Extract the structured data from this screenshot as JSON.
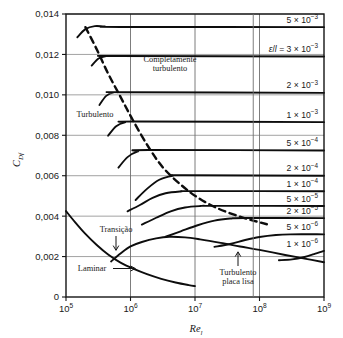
{
  "chart_data": {
    "type": "line",
    "title": "",
    "xlabel": "Re",
    "xlabel_sub": "l",
    "ylabel": "C",
    "ylabel_sub": "Df",
    "xscale": "log",
    "yscale": "linear",
    "xlim": [
      100000,
      1000000000
    ],
    "ylim": [
      0,
      0.014
    ],
    "grid": true,
    "xticks": [
      {
        "value": 100000,
        "mantissa": "10",
        "exponent": "5"
      },
      {
        "value": 1000000,
        "mantissa": "10",
        "exponent": "6"
      },
      {
        "value": 10000000,
        "mantissa": "10",
        "exponent": "7"
      },
      {
        "value": 100000000,
        "mantissa": "10",
        "exponent": "8"
      },
      {
        "value": 1000000000,
        "mantissa": "10",
        "exponent": "9"
      }
    ],
    "yticks": [
      {
        "value": 0,
        "label": "0"
      },
      {
        "value": 0.002,
        "label": "0,002"
      },
      {
        "value": 0.004,
        "label": "0,004"
      },
      {
        "value": 0.006,
        "label": "0,006"
      },
      {
        "value": 0.008,
        "label": "0,008"
      },
      {
        "value": 0.01,
        "label": "0,010"
      },
      {
        "value": 0.012,
        "label": "0,012"
      },
      {
        "value": 0.014,
        "label": "0,014"
      }
    ],
    "right_labels": [
      {
        "id": "r5e3",
        "text": "5 × 10",
        "exp": "-3",
        "plateau": 0.01335,
        "prefix": ""
      },
      {
        "id": "r3e3",
        "text": " = 3 × 10",
        "exp": "-3",
        "plateau": 0.0119,
        "prefix": "eps_over_l"
      },
      {
        "id": "r2e3",
        "text": "2 × 10",
        "exp": "-3",
        "plateau": 0.0101,
        "prefix": ""
      },
      {
        "id": "r1e3",
        "text": "1 × 10",
        "exp": "-3",
        "plateau": 0.00865,
        "prefix": ""
      },
      {
        "id": "r5e4",
        "text": "5 × 10",
        "exp": "-4",
        "plateau": 0.00725,
        "prefix": ""
      },
      {
        "id": "r2e4",
        "text": "2 × 10",
        "exp": "-4",
        "plateau": 0.006,
        "prefix": ""
      },
      {
        "id": "r1e4",
        "text": "1 × 10",
        "exp": "-4",
        "plateau": 0.00523,
        "prefix": ""
      },
      {
        "id": "r5e5",
        "text": "5 × 10",
        "exp": "-5",
        "plateau": 0.0045,
        "prefix": ""
      },
      {
        "id": "r2e5",
        "text": "2 × 10",
        "exp": "-5",
        "plateau": 0.0039,
        "prefix": ""
      },
      {
        "id": "r5e6",
        "text": "5 × 10",
        "exp": "-6",
        "plateau": 0.0031,
        "prefix": ""
      },
      {
        "id": "r1e6",
        "text": "1 × 10",
        "exp": "-6",
        "plateau": 0.00225,
        "prefix": ""
      }
    ],
    "eps_symbol": "ε",
    "eps_denominator": "l",
    "annotations": [
      {
        "id": "completamente-turbulento",
        "line1": "Completamente",
        "line2": "turbulento",
        "x": 170,
        "y": 62
      },
      {
        "id": "turbulento",
        "line1": "Turbulento",
        "line2": "",
        "x": 95,
        "y": 117
      },
      {
        "id": "transicao",
        "line1": "Transição",
        "line2": "",
        "x": 116,
        "y": 232
      },
      {
        "id": "laminar",
        "line1": "Laminar",
        "line2": "",
        "x": 92,
        "y": 271
      },
      {
        "id": "turbulento-placa-lisa",
        "line1": "Turbulento",
        "line2": "placa lisa",
        "x": 238,
        "y": 275
      }
    ],
    "series": [
      {
        "name": "laminar",
        "style": "solid",
        "points": [
          [
            100000,
            0.00425
          ],
          [
            140000,
            0.00368
          ],
          [
            200000,
            0.00312
          ],
          [
            300000,
            0.00257
          ],
          [
            450000,
            0.0021
          ],
          [
            700000,
            0.0017
          ],
          [
            1100000,
            0.0014
          ],
          [
            1800000,
            0.00113
          ],
          [
            3000000,
            0.0009
          ],
          [
            5000000,
            0.00072
          ],
          [
            8000000,
            0.00059
          ],
          [
            10000000,
            0.00054
          ]
        ]
      },
      {
        "name": "turbulent-smooth-plate",
        "style": "solid",
        "points": [
          [
            500000,
            0.00176
          ],
          [
            700000,
            0.00215
          ],
          [
            1000000,
            0.0025
          ],
          [
            1500000,
            0.00272
          ],
          [
            2500000,
            0.0029
          ],
          [
            4000000,
            0.00298
          ],
          [
            7000000,
            0.00295
          ],
          [
            12000000,
            0.00285
          ],
          [
            25000000,
            0.00268
          ],
          [
            50000000,
            0.0025
          ],
          [
            100000000,
            0.00233
          ],
          [
            250000000,
            0.00208
          ],
          [
            500000000,
            0.0019
          ],
          [
            1000000000,
            0.00172
          ]
        ]
      },
      {
        "name": "rough-5e-3",
        "style": "solid",
        "points": [
          [
            150000,
            0.01285
          ],
          [
            200000,
            0.01325
          ],
          [
            280000,
            0.0134
          ],
          [
            400000,
            0.01338
          ],
          [
            700000,
            0.01336
          ],
          [
            1000000000,
            0.01335
          ]
        ]
      },
      {
        "name": "rough-3e-3",
        "style": "solid",
        "points": [
          [
            250000,
            0.01145
          ],
          [
            320000,
            0.0118
          ],
          [
            420000,
            0.01192
          ],
          [
            600000,
            0.01192
          ],
          [
            1000000000,
            0.0119
          ]
        ]
      },
      {
        "name": "rough-2e-3",
        "style": "solid",
        "points": [
          [
            330000,
            0.0095
          ],
          [
            420000,
            0.00995
          ],
          [
            560000,
            0.01012
          ],
          [
            800000,
            0.01013
          ],
          [
            1000000000,
            0.0101
          ]
        ]
      },
      {
        "name": "rough-1e-3",
        "style": "solid",
        "points": [
          [
            450000,
            0.00798
          ],
          [
            600000,
            0.00845
          ],
          [
            820000,
            0.00864
          ],
          [
            1200000,
            0.00868
          ],
          [
            1000000000,
            0.00865
          ]
        ]
      },
      {
        "name": "rough-5e-4",
        "style": "solid",
        "points": [
          [
            650000,
            0.0064
          ],
          [
            900000,
            0.00692
          ],
          [
            1300000,
            0.0072
          ],
          [
            1900000,
            0.00727
          ],
          [
            1000000000,
            0.00725
          ]
        ]
      },
      {
        "name": "rough-2e-4",
        "style": "solid",
        "points": [
          [
            1200000,
            0.0048
          ],
          [
            1800000,
            0.00535
          ],
          [
            2800000,
            0.0058
          ],
          [
            4500000,
            0.00599
          ],
          [
            7000000,
            0.00602
          ],
          [
            1000000000,
            0.006
          ]
        ]
      },
      {
        "name": "rough-1e-4",
        "style": "solid",
        "points": [
          [
            900000,
            0.00424
          ],
          [
            1400000,
            0.00455
          ],
          [
            2200000,
            0.0049
          ],
          [
            3500000,
            0.00513
          ],
          [
            6000000,
            0.00522
          ],
          [
            10000000,
            0.00524
          ],
          [
            1000000000,
            0.00523
          ]
        ]
      },
      {
        "name": "rough-5e-5",
        "style": "solid",
        "points": [
          [
            1500000,
            0.00358
          ],
          [
            2500000,
            0.00392
          ],
          [
            4200000,
            0.00424
          ],
          [
            7000000,
            0.00443
          ],
          [
            12000000,
            0.0045
          ],
          [
            20000000,
            0.00451
          ],
          [
            1000000000,
            0.0045
          ]
        ]
      },
      {
        "name": "rough-2e-5",
        "style": "solid",
        "points": [
          [
            3500000,
            0.00298
          ],
          [
            6000000,
            0.00325
          ],
          [
            11000000,
            0.00355
          ],
          [
            20000000,
            0.00378
          ],
          [
            35000000,
            0.00388
          ],
          [
            60000000,
            0.00391
          ],
          [
            1000000000,
            0.0039
          ]
        ]
      },
      {
        "name": "rough-5e-6",
        "style": "solid",
        "points": [
          [
            20000000,
            0.00248
          ],
          [
            35000000,
            0.00262
          ],
          [
            60000000,
            0.00282
          ],
          [
            100000000,
            0.00297
          ],
          [
            180000000,
            0.00307
          ],
          [
            300000000,
            0.0031
          ],
          [
            1000000000,
            0.0031
          ]
        ]
      },
      {
        "name": "rough-1e-6",
        "style": "solid",
        "points": [
          [
            200000000,
            0.00182
          ],
          [
            320000000,
            0.00186
          ],
          [
            500000000,
            0.00198
          ],
          [
            700000000,
            0.00212
          ],
          [
            1000000000,
            0.00228
          ]
        ]
      },
      {
        "name": "fully-rough-onset",
        "style": "dashed",
        "points": [
          [
            200000,
            0.01335
          ],
          [
            300000,
            0.01225
          ],
          [
            450000,
            0.01105
          ],
          [
            700000,
            0.0099
          ],
          [
            1100000,
            0.00872
          ],
          [
            1900000,
            0.00742
          ],
          [
            3200000,
            0.0064
          ],
          [
            6000000,
            0.00556
          ],
          [
            11000000,
            0.00492
          ],
          [
            22000000,
            0.0044
          ],
          [
            45000000,
            0.00402
          ],
          [
            80000000,
            0.00378
          ],
          [
            130000000,
            0.0036
          ]
        ]
      }
    ]
  },
  "axes": {
    "y_axis_title_main": "C",
    "y_axis_title_sub": "Df",
    "x_axis_title_main": "Re",
    "x_axis_title_sub": "l"
  }
}
